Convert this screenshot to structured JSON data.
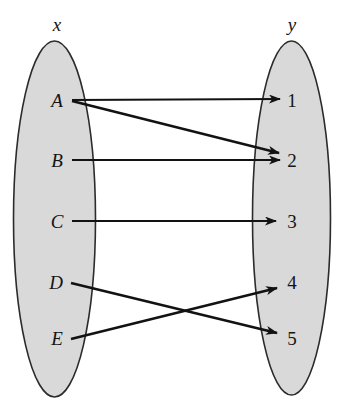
{
  "figure": {
    "type": "mapping-diagram",
    "title": "",
    "background_color": "#ffffff",
    "ellipse_fill": "#d9d9d9",
    "ellipse_stroke": "#2b2b2b",
    "arrow_color": "#121212"
  },
  "sets": {
    "left": {
      "label": "x",
      "label_x": 57,
      "label_y": 31,
      "cx": 54.5,
      "cy": 219,
      "rx": 41,
      "ry": 178,
      "elements": [
        {
          "label": "A",
          "x": 57,
          "y": 107,
          "row_y": 100
        },
        {
          "label": "B",
          "x": 57,
          "y": 167,
          "row_y": 160
        },
        {
          "label": "C",
          "x": 57,
          "y": 228,
          "row_y": 221
        },
        {
          "label": "D",
          "x": 56,
          "y": 289,
          "row_y": 282
        },
        {
          "label": "E",
          "x": 57,
          "y": 345,
          "row_y": 338
        }
      ]
    },
    "right": {
      "label": "y",
      "label_x": 292,
      "label_y": 31,
      "cx": 291.5,
      "cy": 218,
      "rx": 39,
      "ry": 177,
      "elements": [
        {
          "label": "1",
          "x": 292,
          "y": 107,
          "row_y": 100
        },
        {
          "label": "2",
          "x": 292,
          "y": 167,
          "row_y": 160
        },
        {
          "label": "3",
          "x": 292,
          "y": 228,
          "row_y": 221
        },
        {
          "label": "4",
          "x": 292,
          "y": 289,
          "row_y": 282
        },
        {
          "label": "5",
          "x": 292,
          "y": 345,
          "row_y": 338
        }
      ]
    }
  },
  "arrows": [
    {
      "from": "A",
      "to": "1",
      "x1": 72,
      "y1": 100,
      "x2": 280,
      "y2": 99
    },
    {
      "from": "A",
      "to": "2",
      "x1": 72,
      "y1": 101,
      "x2": 279,
      "y2": 153
    },
    {
      "from": "B",
      "to": "2",
      "x1": 72,
      "y1": 160,
      "x2": 280,
      "y2": 160
    },
    {
      "from": "C",
      "to": "3",
      "x1": 72,
      "y1": 221,
      "x2": 276,
      "y2": 221
    },
    {
      "from": "D",
      "to": "5",
      "x1": 71,
      "y1": 283,
      "x2": 277,
      "y2": 333
    },
    {
      "from": "E",
      "to": "4",
      "x1": 71,
      "y1": 339,
      "x2": 277,
      "y2": 288
    }
  ]
}
